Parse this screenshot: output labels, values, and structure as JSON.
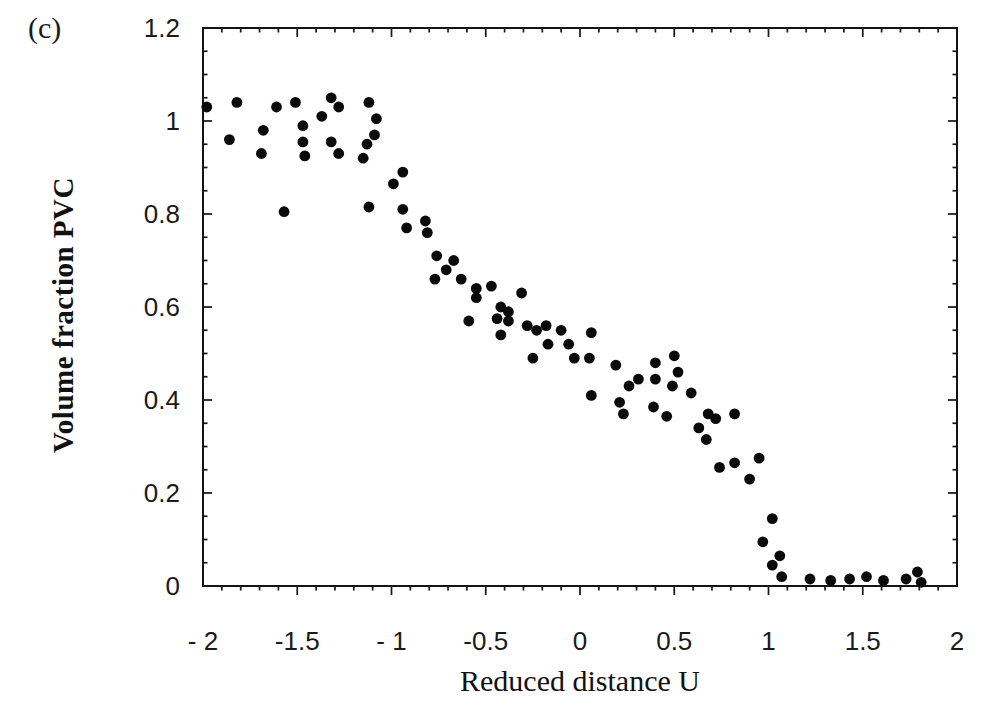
{
  "figure_label": "(c)",
  "colors": {
    "background": "#ffffff",
    "axis": "#141414",
    "dot": "#0a0a0a",
    "text": "#111111"
  },
  "chart_data": {
    "type": "scatter",
    "title": "",
    "xlabel": "Reduced distance U",
    "ylabel": "Volume fraction PVC",
    "xlim": [
      -2,
      2
    ],
    "ylim": [
      0,
      1.2
    ],
    "grid": false,
    "legend": "none",
    "marker": "filled-circle",
    "x_ticks": {
      "values": [
        -2,
        -1.5,
        -1,
        -0.5,
        0,
        0.5,
        1,
        1.5,
        2
      ],
      "labels": [
        "- 2",
        "-1.5",
        "- 1",
        "-0.5",
        "0",
        "0.5",
        "1",
        "1.5",
        "2"
      ]
    },
    "y_ticks": {
      "values": [
        0,
        0.2,
        0.4,
        0.6,
        0.8,
        1,
        1.2
      ],
      "labels": [
        "0",
        "0.2",
        "0.4",
        "0.6",
        "0.8",
        "1",
        "1.2"
      ]
    },
    "x_minor_step": 0.1,
    "y_minor_step": 0.05,
    "points": [
      [
        -1.98,
        1.03
      ],
      [
        -1.82,
        1.04
      ],
      [
        -1.86,
        0.96
      ],
      [
        -1.68,
        0.98
      ],
      [
        -1.69,
        0.93
      ],
      [
        -1.61,
        1.03
      ],
      [
        -1.51,
        1.04
      ],
      [
        -1.47,
        0.99
      ],
      [
        -1.47,
        0.955
      ],
      [
        -1.46,
        0.925
      ],
      [
        -1.37,
        1.01
      ],
      [
        -1.32,
        1.05
      ],
      [
        -1.28,
        1.03
      ],
      [
        -1.32,
        0.955
      ],
      [
        -1.28,
        0.93
      ],
      [
        -1.15,
        0.92
      ],
      [
        -1.12,
        1.04
      ],
      [
        -1.08,
        1.005
      ],
      [
        -1.09,
        0.97
      ],
      [
        -1.13,
        0.95
      ],
      [
        -1.57,
        0.805
      ],
      [
        -0.94,
        0.89
      ],
      [
        -0.99,
        0.865
      ],
      [
        -1.12,
        0.815
      ],
      [
        -0.94,
        0.81
      ],
      [
        -0.92,
        0.77
      ],
      [
        -0.82,
        0.785
      ],
      [
        -0.81,
        0.76
      ],
      [
        -0.76,
        0.71
      ],
      [
        -0.67,
        0.7
      ],
      [
        -0.71,
        0.68
      ],
      [
        -0.77,
        0.66
      ],
      [
        -0.63,
        0.66
      ],
      [
        -0.55,
        0.64
      ],
      [
        -0.55,
        0.62
      ],
      [
        -0.47,
        0.645
      ],
      [
        -0.31,
        0.63
      ],
      [
        -0.42,
        0.6
      ],
      [
        -0.38,
        0.59
      ],
      [
        -0.44,
        0.575
      ],
      [
        -0.38,
        0.57
      ],
      [
        -0.59,
        0.57
      ],
      [
        -0.42,
        0.54
      ],
      [
        -0.28,
        0.56
      ],
      [
        -0.23,
        0.55
      ],
      [
        -0.18,
        0.56
      ],
      [
        -0.17,
        0.52
      ],
      [
        -0.1,
        0.55
      ],
      [
        -0.06,
        0.52
      ],
      [
        -0.25,
        0.49
      ],
      [
        -0.03,
        0.49
      ],
      [
        0.05,
        0.49
      ],
      [
        0.06,
        0.545
      ],
      [
        0.19,
        0.475
      ],
      [
        0.06,
        0.41
      ],
      [
        0.26,
        0.43
      ],
      [
        0.31,
        0.445
      ],
      [
        0.4,
        0.48
      ],
      [
        0.5,
        0.495
      ],
      [
        0.4,
        0.445
      ],
      [
        0.52,
        0.46
      ],
      [
        0.49,
        0.43
      ],
      [
        0.59,
        0.415
      ],
      [
        0.21,
        0.395
      ],
      [
        0.23,
        0.37
      ],
      [
        0.39,
        0.385
      ],
      [
        0.46,
        0.365
      ],
      [
        0.68,
        0.37
      ],
      [
        0.72,
        0.36
      ],
      [
        0.82,
        0.37
      ],
      [
        0.63,
        0.34
      ],
      [
        0.67,
        0.315
      ],
      [
        0.74,
        0.255
      ],
      [
        0.82,
        0.265
      ],
      [
        0.95,
        0.275
      ],
      [
        0.9,
        0.23
      ],
      [
        1.02,
        0.145
      ],
      [
        0.97,
        0.095
      ],
      [
        1.06,
        0.065
      ],
      [
        1.02,
        0.045
      ],
      [
        1.07,
        0.02
      ],
      [
        1.22,
        0.015
      ],
      [
        1.33,
        0.012
      ],
      [
        1.43,
        0.015
      ],
      [
        1.52,
        0.02
      ],
      [
        1.61,
        0.012
      ],
      [
        1.73,
        0.015
      ],
      [
        1.79,
        0.03
      ],
      [
        1.81,
        0.008
      ]
    ]
  }
}
